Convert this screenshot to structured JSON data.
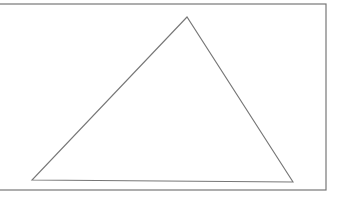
{
  "diagram": {
    "background": "#ffffff",
    "stroke_color": "#777777",
    "rectangle": {
      "x": -2,
      "y": 4,
      "width": 328,
      "height": 186
    },
    "triangle": {
      "points": [
        [
          187,
          17
        ],
        [
          32,
          180
        ],
        [
          293,
          182
        ]
      ]
    }
  }
}
